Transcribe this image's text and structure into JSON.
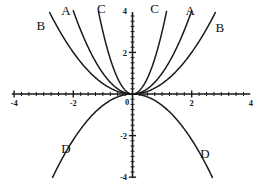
{
  "chart_data": {
    "type": "line",
    "title": "",
    "xlabel": "",
    "ylabel": "",
    "xlim": [
      -4,
      4
    ],
    "ylim": [
      -4,
      4
    ],
    "grid": false,
    "legend_position": "inline-curve-labels",
    "x_ticks": [
      -4,
      -2,
      0,
      2,
      4
    ],
    "y_ticks": [
      -4,
      -2,
      0,
      2,
      4
    ],
    "x_tick_labels": [
      "-4",
      "-2",
      "0",
      "2",
      "4"
    ],
    "y_tick_labels": [
      "-4",
      "-2",
      "",
      "2",
      "4"
    ],
    "minor_tick_step": 0.25,
    "origin_label": "0",
    "series": [
      {
        "name": "B",
        "label": "B",
        "description": "widest upward curve, passes near (2,2) and (-2,2)",
        "power": 2,
        "coefficient": 0.5,
        "direction": "up",
        "points_right": [
          [
            0,
            0
          ],
          [
            0.5,
            0.125
          ],
          [
            1,
            0.5
          ],
          [
            1.5,
            1.125
          ],
          [
            2,
            2
          ],
          [
            2.5,
            3.125
          ],
          [
            2.8,
            3.92
          ]
        ],
        "points_left": [
          [
            0,
            0
          ],
          [
            -0.5,
            0.125
          ],
          [
            -1,
            0.5
          ],
          [
            -1.5,
            1.125
          ],
          [
            -2,
            2
          ],
          [
            -2.5,
            3.125
          ],
          [
            -2.8,
            3.92
          ]
        ]
      },
      {
        "name": "A",
        "label": "A",
        "description": "middle upward curve, x squared",
        "power": 2,
        "coefficient": 1,
        "direction": "up",
        "points_right": [
          [
            0,
            0
          ],
          [
            0.4,
            0.16
          ],
          [
            0.8,
            0.64
          ],
          [
            1.2,
            1.44
          ],
          [
            1.6,
            2.56
          ],
          [
            2,
            4
          ]
        ],
        "points_left": [
          [
            0,
            0
          ],
          [
            -0.4,
            0.16
          ],
          [
            -0.8,
            0.64
          ],
          [
            -1.2,
            1.44
          ],
          [
            -1.6,
            2.56
          ],
          [
            -2,
            4
          ]
        ]
      },
      {
        "name": "C",
        "label": "C",
        "description": "steepest upward curve",
        "power": 2,
        "coefficient": 3,
        "direction": "up",
        "points_right": [
          [
            0,
            0
          ],
          [
            0.25,
            0.19
          ],
          [
            0.5,
            0.75
          ],
          [
            0.75,
            1.69
          ],
          [
            1,
            3
          ],
          [
            1.15,
            3.97
          ]
        ],
        "points_left": [
          [
            0,
            0
          ],
          [
            -0.25,
            0.19
          ],
          [
            -0.5,
            0.75
          ],
          [
            -0.75,
            1.69
          ],
          [
            -1,
            3
          ],
          [
            -1.15,
            3.97
          ]
        ]
      },
      {
        "name": "D",
        "label": "D",
        "description": "downward opening curve, negative x squared scaled",
        "power": 2,
        "coefficient": -0.55,
        "direction": "down",
        "points_right": [
          [
            0,
            0
          ],
          [
            0.5,
            -0.14
          ],
          [
            1,
            -0.55
          ],
          [
            1.5,
            -1.24
          ],
          [
            2,
            -2.2
          ],
          [
            2.5,
            -3.44
          ],
          [
            2.7,
            -4.0
          ]
        ],
        "points_left": [
          [
            0,
            0
          ],
          [
            -0.5,
            -0.14
          ],
          [
            -1,
            -0.55
          ],
          [
            -1.5,
            -1.24
          ],
          [
            -2,
            -2.2
          ],
          [
            -2.5,
            -3.44
          ],
          [
            -2.7,
            -4.0
          ]
        ]
      }
    ],
    "curve_labels": [
      {
        "text": "B",
        "side": "left",
        "x": -3.1,
        "y": 3.1
      },
      {
        "text": "A",
        "side": "left",
        "x": -2.25,
        "y": 3.82
      },
      {
        "text": "C",
        "side": "left",
        "x": -1.05,
        "y": 3.88
      },
      {
        "text": "C",
        "side": "right",
        "x": 0.75,
        "y": 3.88
      },
      {
        "text": "A",
        "side": "right",
        "x": 1.95,
        "y": 3.82
      },
      {
        "text": "B",
        "side": "right",
        "x": 2.95,
        "y": 3.0
      },
      {
        "text": "D",
        "side": "left",
        "x": -2.25,
        "y": -2.85
      },
      {
        "text": "D",
        "side": "right",
        "x": 2.45,
        "y": -3.1
      }
    ]
  }
}
